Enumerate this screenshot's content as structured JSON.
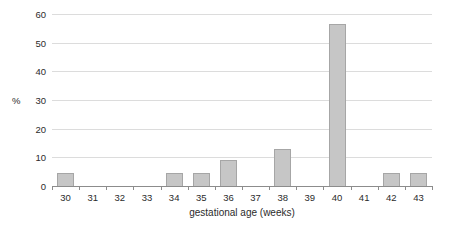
{
  "chart_data": {
    "type": "bar",
    "categories": [
      "30",
      "31",
      "32",
      "33",
      "34",
      "35",
      "36",
      "37",
      "38",
      "39",
      "40",
      "41",
      "42",
      "43"
    ],
    "values": [
      4.5,
      0,
      0,
      0,
      4.5,
      4.5,
      9,
      0,
      13,
      0,
      56.5,
      0,
      4.5,
      4.5
    ],
    "title": "",
    "xlabel": "gestational age (weeks)",
    "ylabel": "%",
    "ylim": [
      0,
      60
    ],
    "yticks": [
      0,
      10,
      20,
      30,
      40,
      50,
      60
    ],
    "grid": true,
    "legend": "none",
    "colors": {
      "bar_fill": "#c6c6c6",
      "bar_dot": "#949494",
      "bar_border": "#a6a6a6",
      "gridline": "#dcdcdc",
      "axis_line": "#8c8c8c",
      "text": "#2b2b2b",
      "background": "#ffffff"
    }
  }
}
